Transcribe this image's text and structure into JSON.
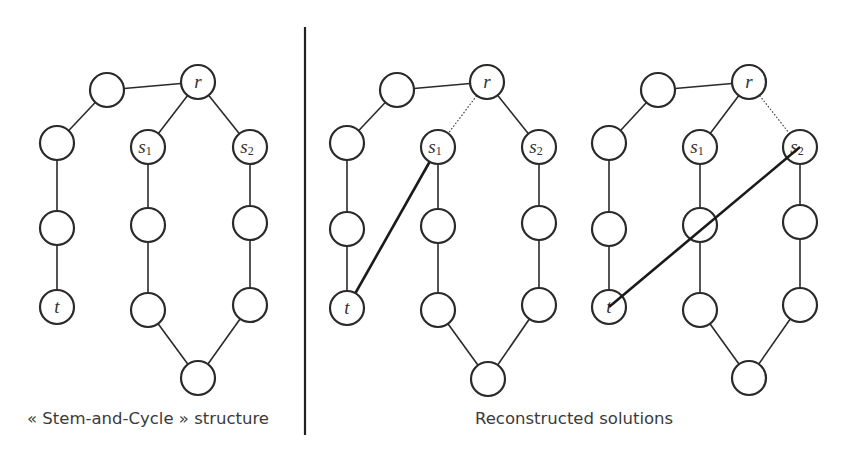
{
  "figure": {
    "divider": {
      "x": 305,
      "y1": 27,
      "y2": 435
    },
    "node_radius": 17,
    "panels": [
      {
        "id": "stem-and-cycle",
        "caption": "« Stem-and-Cycle » structure",
        "caption_pos": {
          "x": 27,
          "y": 424
        },
        "nodes": [
          {
            "id": "a",
            "x": 107,
            "y": 90,
            "label": ""
          },
          {
            "id": "r",
            "x": 198,
            "y": 82,
            "label": "r"
          },
          {
            "id": "b",
            "x": 57,
            "y": 143,
            "label": ""
          },
          {
            "id": "c",
            "x": 57,
            "y": 228,
            "label": ""
          },
          {
            "id": "t",
            "x": 57,
            "y": 307,
            "label": "t"
          },
          {
            "id": "s1",
            "x": 148,
            "y": 147,
            "label": "s",
            "sub": "1"
          },
          {
            "id": "d",
            "x": 148,
            "y": 225,
            "label": ""
          },
          {
            "id": "e",
            "x": 148,
            "y": 310,
            "label": ""
          },
          {
            "id": "s2",
            "x": 250,
            "y": 147,
            "label": "s",
            "sub": "2"
          },
          {
            "id": "f",
            "x": 250,
            "y": 223,
            "label": ""
          },
          {
            "id": "g",
            "x": 250,
            "y": 305,
            "label": ""
          },
          {
            "id": "h",
            "x": 198,
            "y": 378,
            "label": ""
          }
        ],
        "edges": [
          {
            "from": "a",
            "to": "r",
            "style": "solid"
          },
          {
            "from": "a",
            "to": "b",
            "style": "solid"
          },
          {
            "from": "b",
            "to": "c",
            "style": "solid"
          },
          {
            "from": "c",
            "to": "t",
            "style": "solid"
          },
          {
            "from": "r",
            "to": "s1",
            "style": "solid"
          },
          {
            "from": "r",
            "to": "s2",
            "style": "solid"
          },
          {
            "from": "s1",
            "to": "d",
            "style": "solid"
          },
          {
            "from": "d",
            "to": "e",
            "style": "solid"
          },
          {
            "from": "e",
            "to": "h",
            "style": "solid"
          },
          {
            "from": "s2",
            "to": "f",
            "style": "solid"
          },
          {
            "from": "f",
            "to": "g",
            "style": "solid"
          },
          {
            "from": "g",
            "to": "h",
            "style": "solid"
          }
        ]
      },
      {
        "id": "reconstructed-1",
        "caption": "",
        "nodes": [
          {
            "id": "a",
            "x": 397,
            "y": 90,
            "label": ""
          },
          {
            "id": "r",
            "x": 487,
            "y": 82,
            "label": "r"
          },
          {
            "id": "b",
            "x": 347,
            "y": 143,
            "label": ""
          },
          {
            "id": "c",
            "x": 347,
            "y": 229,
            "label": ""
          },
          {
            "id": "t",
            "x": 347,
            "y": 308,
            "label": "t"
          },
          {
            "id": "s1",
            "x": 438,
            "y": 147,
            "label": "s",
            "sub": "1"
          },
          {
            "id": "d",
            "x": 438,
            "y": 226,
            "label": ""
          },
          {
            "id": "e",
            "x": 438,
            "y": 310,
            "label": ""
          },
          {
            "id": "s2",
            "x": 539,
            "y": 147,
            "label": "s",
            "sub": "2"
          },
          {
            "id": "f",
            "x": 539,
            "y": 223,
            "label": ""
          },
          {
            "id": "g",
            "x": 539,
            "y": 305,
            "label": ""
          },
          {
            "id": "h",
            "x": 488,
            "y": 379,
            "label": ""
          }
        ],
        "edges": [
          {
            "from": "a",
            "to": "r",
            "style": "solid"
          },
          {
            "from": "a",
            "to": "b",
            "style": "solid"
          },
          {
            "from": "b",
            "to": "c",
            "style": "solid"
          },
          {
            "from": "c",
            "to": "t",
            "style": "solid"
          },
          {
            "from": "r",
            "to": "s1",
            "style": "dotted"
          },
          {
            "from": "r",
            "to": "s2",
            "style": "solid"
          },
          {
            "from": "s1",
            "to": "d",
            "style": "solid"
          },
          {
            "from": "d",
            "to": "e",
            "style": "solid"
          },
          {
            "from": "e",
            "to": "h",
            "style": "solid"
          },
          {
            "from": "s2",
            "to": "f",
            "style": "solid"
          },
          {
            "from": "f",
            "to": "g",
            "style": "solid"
          },
          {
            "from": "g",
            "to": "h",
            "style": "solid"
          },
          {
            "from": "t",
            "to": "s1",
            "style": "bold"
          }
        ]
      },
      {
        "id": "reconstructed-2",
        "caption": "",
        "nodes": [
          {
            "id": "a",
            "x": 658,
            "y": 90,
            "label": ""
          },
          {
            "id": "r",
            "x": 749,
            "y": 82,
            "label": "r"
          },
          {
            "id": "b",
            "x": 609,
            "y": 143,
            "label": ""
          },
          {
            "id": "c",
            "x": 609,
            "y": 229,
            "label": ""
          },
          {
            "id": "t",
            "x": 609,
            "y": 307,
            "label": "t"
          },
          {
            "id": "s1",
            "x": 700,
            "y": 147,
            "label": "s",
            "sub": "1"
          },
          {
            "id": "d",
            "x": 700,
            "y": 225,
            "label": ""
          },
          {
            "id": "e",
            "x": 700,
            "y": 310,
            "label": ""
          },
          {
            "id": "s2",
            "x": 800,
            "y": 147,
            "label": "s",
            "sub": "2"
          },
          {
            "id": "f",
            "x": 800,
            "y": 222,
            "label": ""
          },
          {
            "id": "g",
            "x": 800,
            "y": 305,
            "label": ""
          },
          {
            "id": "h",
            "x": 749,
            "y": 378,
            "label": ""
          }
        ],
        "edges": [
          {
            "from": "a",
            "to": "r",
            "style": "solid"
          },
          {
            "from": "a",
            "to": "b",
            "style": "solid"
          },
          {
            "from": "b",
            "to": "c",
            "style": "solid"
          },
          {
            "from": "c",
            "to": "t",
            "style": "solid"
          },
          {
            "from": "r",
            "to": "s1",
            "style": "solid"
          },
          {
            "from": "r",
            "to": "s2",
            "style": "dotted"
          },
          {
            "from": "s1",
            "to": "d",
            "style": "solid"
          },
          {
            "from": "d",
            "to": "e",
            "style": "solid"
          },
          {
            "from": "e",
            "to": "h",
            "style": "solid"
          },
          {
            "from": "s2",
            "to": "f",
            "style": "solid"
          },
          {
            "from": "f",
            "to": "g",
            "style": "solid"
          },
          {
            "from": "g",
            "to": "h",
            "style": "solid"
          },
          {
            "from": "t",
            "to": "s2",
            "style": "bold",
            "over_nodes": true
          }
        ]
      }
    ],
    "right_caption": {
      "text": "Reconstructed solutions",
      "x": 475,
      "y": 424
    }
  }
}
